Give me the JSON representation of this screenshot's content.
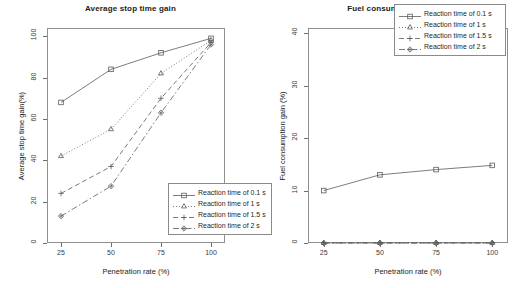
{
  "figure": {
    "width": 523,
    "height": 288,
    "background": "#ffffff",
    "series_color": "#5a5a5a"
  },
  "panels": [
    {
      "id": "left",
      "title": "Average stop time gain",
      "xlabel": "Penetration rate (%)",
      "ylabel": "Average stop time gain(%)",
      "xticks": [
        "25",
        "50",
        "75",
        "100"
      ],
      "yticks": [
        "0",
        "20",
        "40",
        "60",
        "80",
        "100"
      ]
    },
    {
      "id": "right",
      "title": "Fuel consumption gain",
      "xlabel": "Penetration rate (%)",
      "ylabel": "Fuel consumption gain (%)",
      "xticks": [
        "25",
        "50",
        "75",
        "100"
      ],
      "yticks": [
        "0",
        "10",
        "20",
        "30",
        "40"
      ]
    }
  ],
  "legend": {
    "items": [
      {
        "label": "Reaction time of 0.1 s",
        "marker": "square",
        "dash": "solid"
      },
      {
        "label": "Reaction time of 1 s",
        "marker": "triangle",
        "dash": "dotted"
      },
      {
        "label": "Reaction time of 1.5 s",
        "marker": "plus",
        "dash": "dashed"
      },
      {
        "label": "Reaction time of 2 s",
        "marker": "diamond",
        "dash": "dashdot"
      }
    ]
  },
  "chart_data": [
    {
      "type": "line",
      "title": "Average stop time gain",
      "xlabel": "Penetration rate (%)",
      "ylabel": "Average stop time gain(%)",
      "categories": [
        25,
        50,
        75,
        100
      ],
      "x": [
        25,
        50,
        75,
        100
      ],
      "xlim": [
        18,
        107
      ],
      "ylim": [
        0,
        104
      ],
      "xticks": [
        25,
        50,
        75,
        100
      ],
      "yticks": [
        0,
        20,
        40,
        60,
        80,
        100
      ],
      "grid": false,
      "legend_position": "bottom-right",
      "series": [
        {
          "name": "Reaction time of 0.1 s",
          "marker": "square",
          "dash": "solid",
          "values": [
            68,
            84,
            92,
            99
          ]
        },
        {
          "name": "Reaction time of 1 s",
          "marker": "triangle",
          "dash": "dotted",
          "values": [
            42,
            55,
            82,
            98
          ]
        },
        {
          "name": "Reaction time of 1.5 s",
          "marker": "plus",
          "dash": "dashed",
          "values": [
            24,
            37,
            70,
            97
          ]
        },
        {
          "name": "Reaction time of 2 s",
          "marker": "diamond",
          "dash": "dashdot",
          "values": [
            13,
            27.5,
            63,
            96
          ]
        }
      ]
    },
    {
      "type": "line",
      "title": "Fuel consumption gain",
      "xlabel": "Penetration rate (%)",
      "ylabel": "Fuel consumption gain (%)",
      "categories": [
        25,
        50,
        75,
        100
      ],
      "x": [
        25,
        50,
        75,
        100
      ],
      "xlim": [
        18,
        107
      ],
      "ylim": [
        0,
        41
      ],
      "xticks": [
        25,
        50,
        75,
        100
      ],
      "yticks": [
        0,
        10,
        20,
        30,
        40
      ],
      "grid": false,
      "legend_position": "top-right",
      "series": [
        {
          "name": "Reaction time of 0.1 s",
          "marker": "square",
          "dash": "solid",
          "values": [
            10,
            13,
            14,
            14.8
          ]
        },
        {
          "name": "Reaction time of 1 s",
          "marker": "triangle",
          "dash": "dotted",
          "values": [
            0,
            0,
            0,
            0
          ]
        },
        {
          "name": "Reaction time of 1.5 s",
          "marker": "plus",
          "dash": "dashed",
          "values": [
            0,
            0,
            0,
            0
          ]
        },
        {
          "name": "Reaction time of 2 s",
          "marker": "diamond",
          "dash": "dashdot",
          "values": [
            0,
            0,
            0,
            0
          ]
        }
      ]
    }
  ]
}
